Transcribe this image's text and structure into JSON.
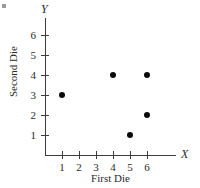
{
  "chart_data": {
    "type": "scatter",
    "title": "",
    "xlabel": "First Die",
    "ylabel": "Second Die",
    "x_axis_name": "X",
    "y_axis_name": "Y",
    "xlim": [
      0,
      7
    ],
    "ylim": [
      0,
      7
    ],
    "x_ticks": [
      1,
      2,
      3,
      4,
      5,
      6
    ],
    "y_ticks": [
      1,
      2,
      3,
      4,
      5,
      6
    ],
    "x_tick_labels": [
      "1",
      "2",
      "3",
      "4",
      "5",
      "6"
    ],
    "y_tick_labels": [
      "1",
      "2",
      "3",
      "4",
      "5",
      "6"
    ],
    "grid": false,
    "legend": false,
    "marker": "filled-circle",
    "marker_color": "#0b0b0b",
    "axis_color": "#3c3c3c",
    "points": [
      {
        "x": 1,
        "y": 3
      },
      {
        "x": 4,
        "y": 4
      },
      {
        "x": 5,
        "y": 1
      },
      {
        "x": 6,
        "y": 2
      },
      {
        "x": 6,
        "y": 4
      }
    ]
  }
}
